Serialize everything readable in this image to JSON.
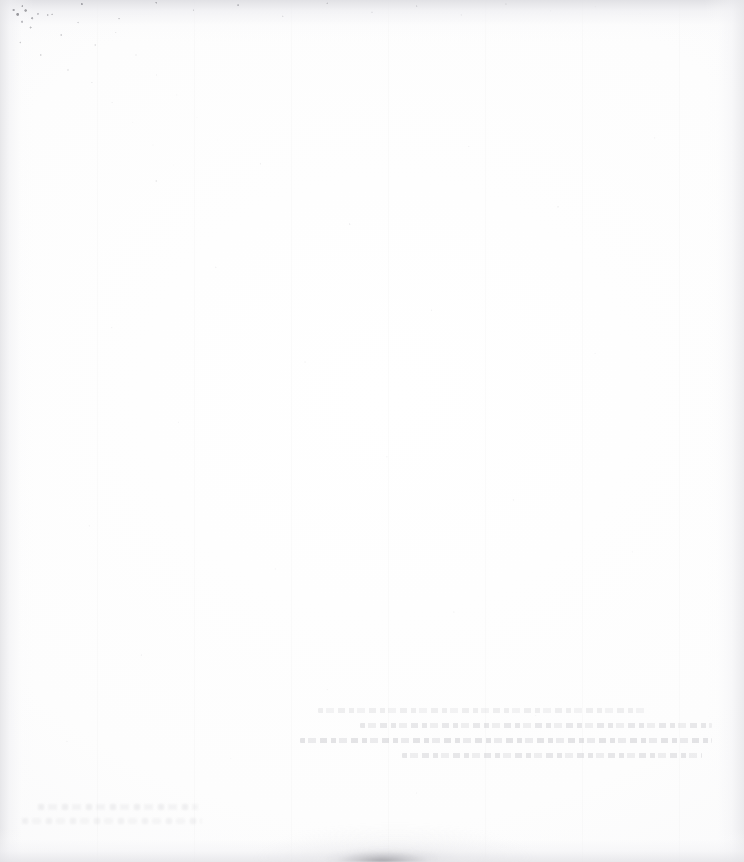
{
  "document": {
    "kind": "scanned-page",
    "page_state": "blank",
    "visible_text": "",
    "width_px": 744,
    "height_px": 862
  },
  "appearance": {
    "paper_color": "#ffffff",
    "paper_tint": "#fdfdfe",
    "edge_shadow_color": "#e4e4e7",
    "speckle_color": "#5a5a60",
    "showthrough_color": "#96969e",
    "smudge_color": "#696970"
  },
  "artifacts": {
    "top_speckle_band": {
      "label": "top-edge speckled scan band",
      "x": 0,
      "y": 0,
      "width": 744,
      "height": 34
    },
    "corner_grain": {
      "label": "top-left corner heavy grain",
      "x": 0,
      "y": 0,
      "width": 340,
      "height": 250
    },
    "showthrough_block": {
      "label": "faint verso show-through text block",
      "x": 300,
      "y": 706,
      "width": 412,
      "height": 62,
      "line_count": 4,
      "legible": false
    },
    "showthrough_bottom_left": {
      "label": "faint bottom-left show-through",
      "x": 14,
      "y": 800,
      "width": 190,
      "height": 34,
      "line_count": 2,
      "legible": false
    },
    "bottom_smudge": {
      "label": "dark smudge at bottom edge center",
      "x": 326,
      "y": 848,
      "width": 112,
      "height": 14
    }
  }
}
